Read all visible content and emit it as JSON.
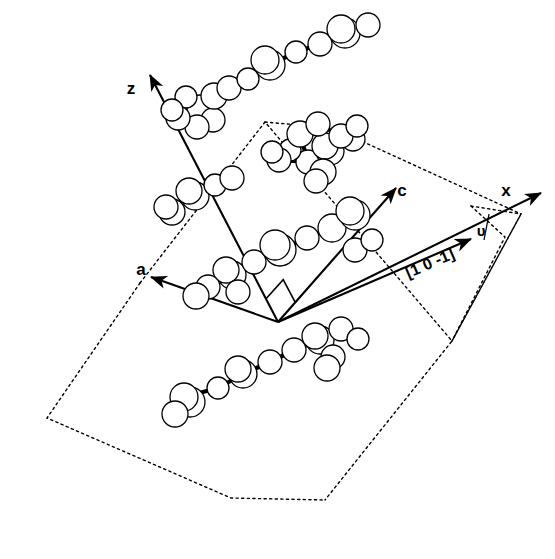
{
  "figure": {
    "type": "crystal-structure-projection",
    "background_color": "#ffffff",
    "line_color": "#000000",
    "atom_fill": "#ffffff",
    "width": 555,
    "height": 559
  },
  "axes": {
    "origin": [
      278,
      322
    ],
    "items": [
      {
        "label": "z",
        "name": "z-axis",
        "tip": [
          150,
          75
        ],
        "tail": [
          278,
          322
        ],
        "label_pos": [
          131,
          94
        ]
      },
      {
        "label": "a",
        "name": "a-axis",
        "tip": [
          151,
          277
        ],
        "tail": [
          278,
          322
        ],
        "label_pos": [
          141,
          275
        ]
      },
      {
        "label": "c",
        "name": "c-axis",
        "tip": [
          396,
          188
        ],
        "tail": [
          278,
          322
        ],
        "label_pos": [
          402,
          196
        ]
      },
      {
        "label": "x",
        "name": "x-axis",
        "tip": [
          541,
          193
        ],
        "tail": [
          278,
          322
        ],
        "label_pos": [
          506,
          196
        ]
      }
    ]
  },
  "direction_vector": {
    "label": "[1 0 -1]",
    "name": "direction-1-0-m1",
    "tail": [
      278,
      322
    ],
    "tip": [
      471,
      239
    ],
    "label_pos": [
      432,
      268
    ],
    "label_rotation": -23.5
  },
  "angle_marker": {
    "label": "υ",
    "name": "upsilon-angle",
    "label_pos": [
      481,
      236
    ],
    "vertex": [
      471,
      206
    ],
    "tick_from": [
      489,
      214
    ],
    "tick_to": [
      484,
      240
    ]
  },
  "right_angle_marker": {
    "name": "right-angle-square",
    "vertex": [
      278,
      322
    ],
    "size": 26
  },
  "unit_cells": [
    {
      "name": "cell-left-front",
      "points": "140,283 47,418 231,498 325,500 325,500"
    },
    {
      "name": "cell-right-front",
      "points": "265,122 140,283 325,500 452,341"
    },
    {
      "name": "cell-right-back",
      "points": "265,122 452,341 521,214 333,128"
    }
  ],
  "cell_outline_points": [
    "140,283 47,418 231,498 325,500",
    "140,283 265,122 452,341 325,500",
    "265,122 333,128 521,214 452,341",
    "452,341 521,214",
    "471,206 505,237 452,341",
    "471,206 521,214"
  ],
  "molecules": [
    {
      "name": "molecule-top-chain",
      "atoms": [
        {
          "cx": 200,
          "cy": 108,
          "r": 13
        },
        {
          "cx": 186,
          "cy": 97,
          "r": 11
        },
        {
          "cx": 213,
          "cy": 120,
          "r": 12
        },
        {
          "cx": 197,
          "cy": 127,
          "r": 12
        },
        {
          "cx": 214,
          "cy": 96,
          "r": 13
        },
        {
          "cx": 229,
          "cy": 88,
          "r": 12
        },
        {
          "cx": 248,
          "cy": 79,
          "r": 11
        },
        {
          "cx": 270,
          "cy": 65,
          "r": 15
        },
        {
          "cx": 265,
          "cy": 60,
          "r": 14
        },
        {
          "cx": 296,
          "cy": 52,
          "r": 11
        },
        {
          "cx": 320,
          "cy": 44,
          "r": 12
        },
        {
          "cx": 345,
          "cy": 33,
          "r": 15
        },
        {
          "cx": 341,
          "cy": 29,
          "r": 14
        },
        {
          "cx": 368,
          "cy": 25,
          "r": 12
        },
        {
          "cx": 178,
          "cy": 118,
          "r": 12
        },
        {
          "cx": 172,
          "cy": 110,
          "r": 11
        }
      ],
      "bonds": [
        [
          186,
          97,
          200,
          108
        ],
        [
          200,
          108,
          213,
          120
        ],
        [
          200,
          108,
          197,
          127
        ],
        [
          200,
          108,
          214,
          96
        ],
        [
          214,
          96,
          229,
          88
        ],
        [
          229,
          88,
          248,
          79
        ],
        [
          248,
          79,
          270,
          65
        ],
        [
          270,
          65,
          296,
          52
        ],
        [
          296,
          52,
          320,
          44
        ],
        [
          320,
          44,
          345,
          33
        ],
        [
          345,
          33,
          368,
          25
        ],
        [
          186,
          97,
          178,
          118
        ],
        [
          178,
          118,
          172,
          110
        ]
      ]
    },
    {
      "name": "molecule-upper-left",
      "atoms": [
        {
          "cx": 195,
          "cy": 196,
          "r": 14
        },
        {
          "cx": 189,
          "cy": 191,
          "r": 13
        },
        {
          "cx": 172,
          "cy": 212,
          "r": 13
        },
        {
          "cx": 166,
          "cy": 207,
          "r": 12
        },
        {
          "cx": 215,
          "cy": 185,
          "r": 11
        },
        {
          "cx": 232,
          "cy": 178,
          "r": 12
        }
      ],
      "bonds": [
        [
          189,
          191,
          172,
          212
        ],
        [
          189,
          191,
          215,
          185
        ],
        [
          215,
          185,
          232,
          178
        ]
      ]
    },
    {
      "name": "molecule-upper-right-chain",
      "atoms": [
        {
          "cx": 308,
          "cy": 162,
          "r": 12
        },
        {
          "cx": 330,
          "cy": 151,
          "r": 14
        },
        {
          "cx": 325,
          "cy": 146,
          "r": 13
        },
        {
          "cx": 353,
          "cy": 139,
          "r": 12
        },
        {
          "cx": 323,
          "cy": 172,
          "r": 13
        },
        {
          "cx": 316,
          "cy": 181,
          "r": 12
        },
        {
          "cx": 290,
          "cy": 150,
          "r": 11
        },
        {
          "cx": 300,
          "cy": 134,
          "r": 13
        },
        {
          "cx": 318,
          "cy": 124,
          "r": 12
        },
        {
          "cx": 341,
          "cy": 136,
          "r": 12
        },
        {
          "cx": 357,
          "cy": 126,
          "r": 11
        },
        {
          "cx": 279,
          "cy": 160,
          "r": 12
        },
        {
          "cx": 272,
          "cy": 152,
          "r": 11
        }
      ],
      "bonds": [
        [
          308,
          162,
          330,
          151
        ],
        [
          330,
          151,
          353,
          139
        ],
        [
          308,
          162,
          323,
          172
        ],
        [
          323,
          172,
          316,
          181
        ],
        [
          308,
          162,
          300,
          134
        ],
        [
          300,
          134,
          318,
          124
        ],
        [
          318,
          124,
          341,
          136
        ],
        [
          341,
          136,
          357,
          126
        ],
        [
          308,
          162,
          279,
          160
        ],
        [
          279,
          160,
          272,
          152
        ],
        [
          300,
          134,
          290,
          150
        ]
      ]
    },
    {
      "name": "molecule-center-chain",
      "atoms": [
        {
          "cx": 232,
          "cy": 275,
          "r": 14
        },
        {
          "cx": 226,
          "cy": 270,
          "r": 13
        },
        {
          "cx": 208,
          "cy": 287,
          "r": 12
        },
        {
          "cx": 196,
          "cy": 296,
          "r": 13
        },
        {
          "cx": 254,
          "cy": 262,
          "r": 12
        },
        {
          "cx": 280,
          "cy": 250,
          "r": 16
        },
        {
          "cx": 275,
          "cy": 245,
          "r": 15
        },
        {
          "cx": 307,
          "cy": 238,
          "r": 12
        },
        {
          "cx": 332,
          "cy": 228,
          "r": 14
        },
        {
          "cx": 355,
          "cy": 215,
          "r": 15
        },
        {
          "cx": 350,
          "cy": 211,
          "r": 14
        },
        {
          "cx": 238,
          "cy": 292,
          "r": 12
        }
      ],
      "bonds": [
        [
          226,
          270,
          208,
          287
        ],
        [
          208,
          287,
          196,
          296
        ],
        [
          226,
          270,
          254,
          262
        ],
        [
          254,
          262,
          280,
          250
        ],
        [
          280,
          250,
          307,
          238
        ],
        [
          307,
          238,
          332,
          228
        ],
        [
          332,
          228,
          355,
          215
        ],
        [
          226,
          270,
          238,
          292
        ]
      ]
    },
    {
      "name": "molecule-lower-chain",
      "atoms": [
        {
          "cx": 190,
          "cy": 402,
          "r": 15
        },
        {
          "cx": 184,
          "cy": 397,
          "r": 14
        },
        {
          "cx": 175,
          "cy": 414,
          "r": 13
        },
        {
          "cx": 218,
          "cy": 388,
          "r": 11
        },
        {
          "cx": 243,
          "cy": 374,
          "r": 14
        },
        {
          "cx": 238,
          "cy": 369,
          "r": 13
        },
        {
          "cx": 270,
          "cy": 362,
          "r": 12
        },
        {
          "cx": 294,
          "cy": 350,
          "r": 12
        },
        {
          "cx": 320,
          "cy": 340,
          "r": 14
        },
        {
          "cx": 315,
          "cy": 336,
          "r": 13
        },
        {
          "cx": 333,
          "cy": 357,
          "r": 12
        },
        {
          "cx": 327,
          "cy": 368,
          "r": 13
        },
        {
          "cx": 341,
          "cy": 329,
          "r": 12
        },
        {
          "cx": 358,
          "cy": 339,
          "r": 11
        }
      ],
      "bonds": [
        [
          184,
          397,
          175,
          414
        ],
        [
          184,
          397,
          218,
          388
        ],
        [
          218,
          388,
          243,
          374
        ],
        [
          243,
          374,
          270,
          362
        ],
        [
          270,
          362,
          294,
          350
        ],
        [
          294,
          350,
          320,
          340
        ],
        [
          320,
          340,
          333,
          357
        ],
        [
          333,
          357,
          327,
          368
        ],
        [
          320,
          340,
          341,
          329
        ],
        [
          341,
          329,
          358,
          339
        ]
      ]
    },
    {
      "name": "molecule-right-edge",
      "atoms": [
        {
          "cx": 355,
          "cy": 250,
          "r": 12
        },
        {
          "cx": 372,
          "cy": 240,
          "r": 11
        }
      ],
      "bonds": [
        [
          355,
          250,
          372,
          240
        ]
      ]
    }
  ]
}
